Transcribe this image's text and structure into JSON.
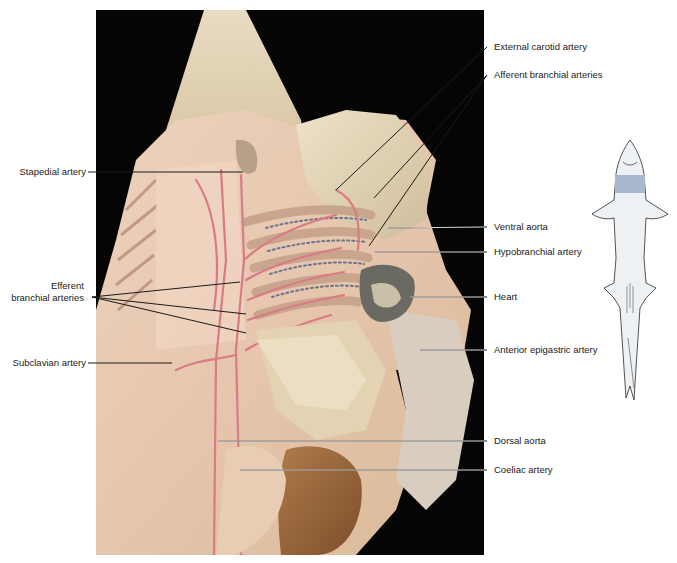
{
  "figure": {
    "type": "anatomical dissection photograph",
    "colors": {
      "background": "#050505",
      "tissue_light": "#e6d7b8",
      "tissue_mid": "#d9c29a",
      "tissue_pink": "#e7b9a6",
      "artery": "#d97a86",
      "vein_blue": "#6d7fa6",
      "heart_gray": "#6b6a62",
      "shark_body": "#eef1f3",
      "shark_highlight": "#a9b8cf",
      "leader_line": "#1a1a1a"
    }
  },
  "labels": {
    "right": [
      {
        "id": "external-carotid-artery",
        "text": "External carotid artery"
      },
      {
        "id": "afferent-branchial-arteries",
        "text": "Afferent branchial arteries"
      },
      {
        "id": "ventral-aorta",
        "text": "Ventral aorta"
      },
      {
        "id": "hypobranchial-artery",
        "text": "Hypobranchial artery"
      },
      {
        "id": "heart",
        "text": "Heart"
      },
      {
        "id": "anterior-epigastric-artery",
        "text": "Anterior epigastric artery"
      },
      {
        "id": "dorsal-aorta",
        "text": "Dorsal aorta"
      },
      {
        "id": "coeliac-artery",
        "text": "Coeliac artery"
      }
    ],
    "left": [
      {
        "id": "stapedial-artery",
        "text": "Stapedial artery"
      },
      {
        "id": "efferent-branchial-arteries",
        "line1": "Efferent",
        "line2": "branchial arteries"
      },
      {
        "id": "subclavian-artery",
        "text": "Subclavian artery"
      }
    ]
  },
  "inset": {
    "description": "shark outline, ventral view, highlighted gill region",
    "highlight_color": "#a9b8cf"
  }
}
